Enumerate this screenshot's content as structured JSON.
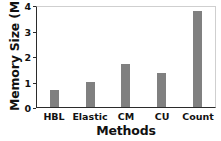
{
  "chart_data": {
    "type": "bar",
    "title": "",
    "xlabel": "Methods",
    "ylabel": "Memory Size (MB)",
    "categories": [
      "HBL",
      "Elastic",
      "CM",
      "CU",
      "Count"
    ],
    "values": [
      0.65,
      0.98,
      1.68,
      1.33,
      3.75
    ],
    "series": [
      {
        "name": "Memory Size",
        "values": [
          0.65,
          0.98,
          1.68,
          1.33,
          3.75
        ]
      }
    ],
    "ylim": [
      0,
      4
    ],
    "yticks": [
      "0",
      "1",
      "2",
      "3",
      "4"
    ],
    "ytick_values": [
      0,
      1,
      2,
      3,
      4
    ],
    "xticks": [
      "HBL",
      "Elastic",
      "CM",
      "CU",
      "Count"
    ],
    "grid": false,
    "legend": false,
    "legend_position": "none",
    "bar_color": "#808080",
    "axis_color": "#2b2b2b",
    "frame_color": "#cfcfcf",
    "background_color": "#ffffff"
  }
}
